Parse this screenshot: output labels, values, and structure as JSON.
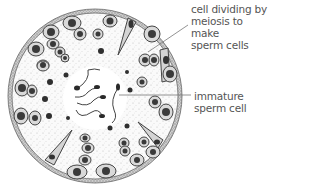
{
  "diagram": {
    "labels": [
      {
        "id": "meiosis",
        "text": "cell dividing by\nmeiosis to make\nsperm cells"
      },
      {
        "id": "immature",
        "text": "immature\nsperm cell"
      }
    ],
    "colors": {
      "outline": "#555555",
      "cell_fill": "#d9d9d9",
      "nucleus": "#3a3a3a",
      "stipple": "#aaaaaa",
      "label_text": "#555555"
    }
  }
}
